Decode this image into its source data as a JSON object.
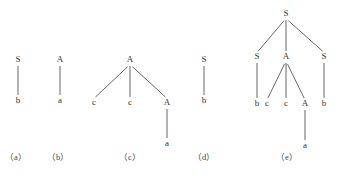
{
  "diagram": {
    "type": "parse-trees",
    "colors": {
      "text": "#333333",
      "edge": "#555555",
      "background": "#ffffff"
    },
    "trees": [
      {
        "id": "a",
        "caption": "（a）",
        "nodes": [
          {
            "id": "a0",
            "label": "S",
            "x": 18,
            "y": 62
          },
          {
            "id": "a1",
            "label": "b",
            "x": 18,
            "y": 103
          }
        ],
        "edges": [
          [
            "a0",
            "a1"
          ]
        ]
      },
      {
        "id": "b",
        "caption": "（b）",
        "nodes": [
          {
            "id": "b0",
            "label": "A",
            "x": 60,
            "y": 62
          },
          {
            "id": "b1",
            "label": "a",
            "x": 60,
            "y": 103
          }
        ],
        "edges": [
          [
            "b0",
            "b1"
          ]
        ]
      },
      {
        "id": "c",
        "caption": "（c）",
        "nodes": [
          {
            "id": "c0",
            "label": "A",
            "x": 130,
            "y": 62
          },
          {
            "id": "c1",
            "label": "c",
            "x": 94,
            "y": 105
          },
          {
            "id": "c2",
            "label": "c",
            "x": 130,
            "y": 105
          },
          {
            "id": "c3",
            "label": "A",
            "x": 167,
            "y": 105
          },
          {
            "id": "c4",
            "label": "a",
            "x": 167,
            "y": 146
          }
        ],
        "edges": [
          [
            "c0",
            "c1"
          ],
          [
            "c0",
            "c2"
          ],
          [
            "c0",
            "c3"
          ],
          [
            "c3",
            "c4"
          ]
        ]
      },
      {
        "id": "d",
        "caption": "（d）",
        "nodes": [
          {
            "id": "d0",
            "label": "S",
            "x": 204,
            "y": 62
          },
          {
            "id": "d1",
            "label": "b",
            "x": 204,
            "y": 103
          }
        ],
        "edges": [
          [
            "d0",
            "d1"
          ]
        ]
      },
      {
        "id": "e",
        "caption": "（e）",
        "nodes": [
          {
            "id": "e0",
            "label": "S",
            "x": 286,
            "y": 16
          },
          {
            "id": "e1",
            "label": "S",
            "x": 257,
            "y": 59
          },
          {
            "id": "e2",
            "label": "A",
            "x": 286,
            "y": 59
          },
          {
            "id": "e3",
            "label": "S",
            "x": 324,
            "y": 59
          },
          {
            "id": "e4",
            "label": "b",
            "x": 257,
            "y": 106
          },
          {
            "id": "e5",
            "label": "c",
            "x": 267,
            "y": 106
          },
          {
            "id": "e6",
            "label": "c",
            "x": 286,
            "y": 106
          },
          {
            "id": "e7",
            "label": "A",
            "x": 305,
            "y": 106
          },
          {
            "id": "e8",
            "label": "b",
            "x": 324,
            "y": 106
          },
          {
            "id": "e9",
            "label": "a",
            "x": 305,
            "y": 148
          }
        ],
        "edges": [
          [
            "e0",
            "e1"
          ],
          [
            "e0",
            "e2"
          ],
          [
            "e0",
            "e3"
          ],
          [
            "e1",
            "e4"
          ],
          [
            "e2",
            "e5"
          ],
          [
            "e2",
            "e6"
          ],
          [
            "e2",
            "e7"
          ],
          [
            "e3",
            "e8"
          ],
          [
            "e7",
            "e9"
          ]
        ]
      }
    ],
    "caption_y": 160,
    "caption_x": {
      "a": 16,
      "b": 58,
      "c": 130,
      "d": 204,
      "e": 287
    }
  }
}
